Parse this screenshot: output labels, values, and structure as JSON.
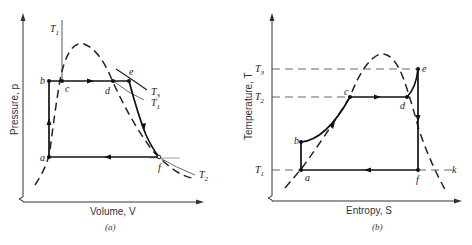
{
  "figure": {
    "panels": [
      {
        "id": "a",
        "caption": "(a)",
        "x_axis_label": "Volume, V",
        "y_axis_label": "Pressure, p",
        "points": [
          "a",
          "b",
          "c",
          "d",
          "e",
          "f"
        ],
        "isotherm_labels": {
          "T1_top": "T",
          "T1_top_sub": "1",
          "T3": "T",
          "T3_sub": "3",
          "T1": "T",
          "T1_sub": "1",
          "T2": "T",
          "T2_sub": "2"
        },
        "point_labels": {
          "a": "a",
          "b": "b",
          "c": "c",
          "d": "d",
          "e": "e",
          "f": "f"
        }
      },
      {
        "id": "b",
        "caption": "(b)",
        "x_axis_label": "Entropy, S",
        "y_axis_label": "Temperature, T",
        "temperature_levels": {
          "T3": "T",
          "T3_sub": "3",
          "T2": "T",
          "T2_sub": "2",
          "T1": "T",
          "T1_sub": "1"
        },
        "point_labels": {
          "a": "a",
          "b": "b",
          "c": "c",
          "d": "d",
          "e": "e",
          "f": "f",
          "k": "k"
        }
      }
    ],
    "line_color": "#1a1a1a",
    "dashed_color": "#2a2a2a",
    "guide_color": "#555555"
  }
}
